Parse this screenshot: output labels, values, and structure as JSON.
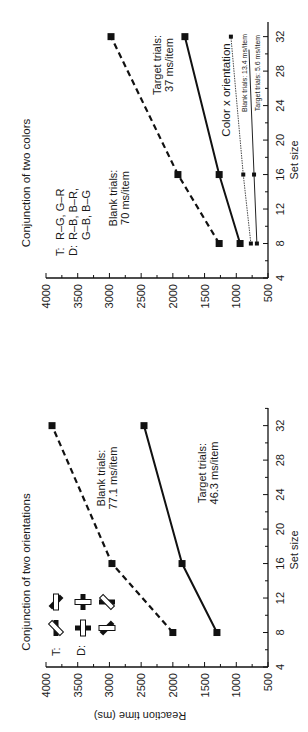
{
  "figure": {
    "panels": [
      {
        "id": "colors",
        "title": "Conjunction of two colors",
        "legend": {
          "target_prefix": "T:",
          "target_text": "R–G, G–R",
          "distractor_prefix": "D:",
          "distractor_line1": "R–B, B–R,",
          "distractor_line2": "G–B, B–G"
        },
        "annotations": {
          "blank_line1": "Blank trials:",
          "blank_line2": "70 ms/item",
          "target_line1": "Target trials:",
          "target_line2": "37 ms/item",
          "cxo_title": "Color x orientation",
          "cxo_blank": "Blank trials: 13.4 ms/item",
          "cxo_target": "Target trials: 5.6 ms/item"
        }
      },
      {
        "id": "orientations",
        "title": "Conjunction of two orientations",
        "legend": {
          "target_prefix": "T:",
          "distractor_prefix": "D:"
        },
        "annotations": {
          "blank_line1": "Blank trials:",
          "blank_line2": "77.1 ms/item",
          "target_line1": "Target trials:",
          "target_line2": "46.3 ms/item"
        }
      }
    ],
    "x_axis_label": "Set size",
    "y_axis_label": "Reaction time (ms)",
    "x_ticks": [
      "4",
      "8",
      "12",
      "16",
      "20",
      "24",
      "28",
      "32"
    ],
    "y_ticks": [
      "4000",
      "3500",
      "3000",
      "2500",
      "2000",
      "1500",
      "1000",
      "500"
    ]
  },
  "chart_data": [
    {
      "type": "line",
      "title": "Conjunction of two colors",
      "xlabel": "Set size",
      "ylabel": "Reaction time (ms)",
      "xlim": [
        4,
        32
      ],
      "ylim": [
        500,
        4000
      ],
      "x_ticks": [
        4,
        8,
        12,
        16,
        20,
        24,
        28,
        32
      ],
      "y_ticks": [
        500,
        1000,
        1500,
        2000,
        2500,
        3000,
        3500,
        4000
      ],
      "grid": false,
      "orientation_note": "figure rotated 90° (set size vertical, RT horizontal)",
      "x": [
        8,
        16,
        32
      ],
      "series": [
        {
          "name": "Blank trials: 70 ms/item",
          "style": "dashed, large squares",
          "values": [
            1270,
            1920,
            2975
          ]
        },
        {
          "name": "Target trials: 37 ms/item",
          "style": "solid, large squares",
          "values": [
            940,
            1270,
            1810
          ]
        },
        {
          "name": "Color x orientation — Blank trials: 13.4 ms/item",
          "style": "thin line, small squares",
          "values": [
            770,
            890,
            1085
          ]
        },
        {
          "name": "Color x orientation — Target trials: 5.6 ms/item",
          "style": "thin line, small squares",
          "values": [
            675,
            720,
            800
          ]
        }
      ],
      "annotations": [
        "T: R-G, G-R",
        "D: R-B, B-R, G-B, B-G"
      ]
    },
    {
      "type": "line",
      "title": "Conjunction of two orientations",
      "xlabel": "Set size",
      "ylabel": "Reaction time (ms)",
      "xlim": [
        4,
        32
      ],
      "ylim": [
        500,
        4000
      ],
      "x_ticks": [
        4,
        8,
        12,
        16,
        20,
        24,
        28,
        32
      ],
      "y_ticks": [
        500,
        1000,
        1500,
        2000,
        2500,
        3000,
        3500,
        4000
      ],
      "grid": false,
      "orientation_note": "figure rotated 90° (set size vertical, RT horizontal)",
      "x": [
        8,
        16,
        32
      ],
      "series": [
        {
          "name": "Blank trials: 77.1 ms/item",
          "style": "dashed, squares",
          "values": [
            2000,
            2960,
            3905
          ]
        },
        {
          "name": "Target trials: 46.3 ms/item",
          "style": "solid, squares",
          "values": [
            1305,
            1855,
            2455
          ]
        }
      ],
      "annotations": [
        "T: bar-cross symbols",
        "D: bar-cross symbols"
      ]
    }
  ]
}
